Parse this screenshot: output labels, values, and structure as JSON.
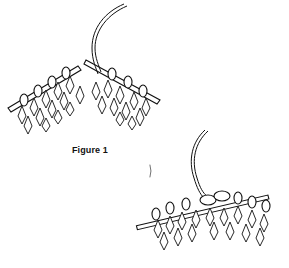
{
  "figures": [
    {
      "id": "figure-1",
      "caption": "Figure 1",
      "description": "Two knitting needles held in a V shape with stitches on each, working yarn coming from the top"
    },
    {
      "id": "figure-2",
      "caption": "",
      "description": "Knitting needles with stitches, yarn wrapped around the needle tip"
    }
  ],
  "colors": {
    "ink": "#111111",
    "background": "#ffffff"
  }
}
